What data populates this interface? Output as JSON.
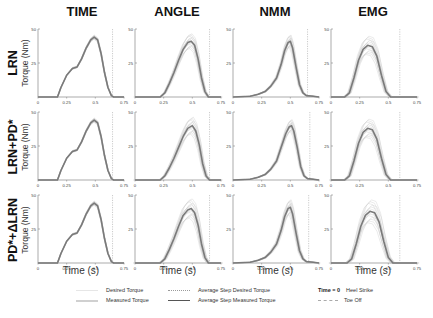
{
  "figure": {
    "column_titles": [
      "TIME",
      "ANGLE",
      "NMM",
      "EMG"
    ],
    "row_labels": [
      {
        "main": "LRN",
        "sub": "Torque (Nm)"
      },
      {
        "main": "LRN+PD*",
        "sub": "Torque (Nm)"
      },
      {
        "main": "PD*+ΔLRN",
        "sub": "Torque (Nm)"
      }
    ],
    "xlabel": "Time (s)",
    "legend": {
      "desired": "Desired Torque",
      "measured": "Measured Torque",
      "avg_desired": "Average Step Desired Torque",
      "avg_measured": "Average Step Measured Torque",
      "heel_strike_key": "Time = 0",
      "heel_strike": "Heel Strike",
      "toe_off": "Toe Off"
    },
    "colors": {
      "avg_measured": "#7a7a7a",
      "individual": "#c8c8c8",
      "axis": "#888888",
      "toe_off": "#aaaaaa"
    }
  },
  "chart_data": [
    {
      "type": "line",
      "row": "LRN",
      "column": "TIME",
      "title": "TIME",
      "xlabel": "",
      "ylabel": "Torque (Nm)",
      "xlim": [
        0,
        0.75
      ],
      "ylim": [
        0,
        50
      ],
      "xticks": [
        0,
        0.25,
        0.5,
        0.75
      ],
      "yticks": [
        0,
        25,
        50
      ],
      "toe_off": 0.65,
      "spread": 1.5,
      "x": [
        0,
        0.17,
        0.2,
        0.25,
        0.3,
        0.34,
        0.38,
        0.42,
        0.46,
        0.49,
        0.52,
        0.55,
        0.58,
        0.61,
        0.64,
        0.66,
        0.7,
        0.75
      ],
      "series": [
        {
          "name": "Average Step Measured Torque",
          "values": [
            0,
            0,
            7,
            16,
            21,
            22,
            28,
            36,
            42,
            44,
            42,
            32,
            18,
            7,
            1,
            0,
            0,
            0
          ]
        }
      ]
    },
    {
      "type": "line",
      "row": "LRN",
      "column": "ANGLE",
      "title": "ANGLE",
      "xlabel": "",
      "ylabel": "",
      "xlim": [
        0,
        0.75
      ],
      "ylim": [
        0,
        50
      ],
      "xticks": [
        0,
        0.25,
        0.5,
        0.75
      ],
      "yticks": [
        0,
        25,
        50
      ],
      "toe_off": 0.65,
      "spread": 6,
      "x": [
        0,
        0.22,
        0.26,
        0.3,
        0.34,
        0.38,
        0.42,
        0.46,
        0.49,
        0.52,
        0.55,
        0.58,
        0.61,
        0.64,
        0.7,
        0.75
      ],
      "series": [
        {
          "name": "Average Step Measured Torque",
          "values": [
            0,
            0,
            3,
            10,
            18,
            27,
            35,
            40,
            41,
            38,
            28,
            14,
            4,
            0,
            0,
            0
          ]
        }
      ]
    },
    {
      "type": "line",
      "row": "LRN",
      "column": "NMM",
      "title": "NMM",
      "xlabel": "",
      "ylabel": "",
      "xlim": [
        0,
        0.75
      ],
      "ylim": [
        0,
        50
      ],
      "xticks": [
        0,
        0.25,
        0.5,
        0.75
      ],
      "yticks": [
        0,
        25,
        50
      ],
      "toe_off": 0.65,
      "spread": 5,
      "x": [
        0,
        0.15,
        0.22,
        0.28,
        0.33,
        0.38,
        0.42,
        0.45,
        0.48,
        0.5,
        0.52,
        0.55,
        0.58,
        0.61,
        0.64,
        0.7,
        0.75
      ],
      "series": [
        {
          "name": "Average Step Measured Torque",
          "values": [
            0,
            0.5,
            2,
            4,
            8,
            14,
            24,
            34,
            40,
            41,
            36,
            22,
            9,
            3,
            1,
            0.5,
            0
          ]
        }
      ]
    },
    {
      "type": "line",
      "row": "LRN",
      "column": "EMG",
      "title": "EMG",
      "xlabel": "",
      "ylabel": "",
      "xlim": [
        0,
        0.75
      ],
      "ylim": [
        0,
        50
      ],
      "xticks": [
        0,
        0.25,
        0.5,
        0.75
      ],
      "yticks": [
        0,
        25,
        50
      ],
      "toe_off": 0.6,
      "spread": 8,
      "x": [
        0,
        0.12,
        0.16,
        0.2,
        0.24,
        0.28,
        0.32,
        0.36,
        0.4,
        0.44,
        0.48,
        0.52,
        0.56,
        0.75
      ],
      "series": [
        {
          "name": "Average Step Measured Torque",
          "values": [
            0,
            0,
            3,
            14,
            27,
            35,
            38,
            37,
            30,
            16,
            4,
            0,
            0,
            0
          ]
        }
      ]
    },
    {
      "type": "line",
      "row": "LRN+PD*",
      "column": "TIME",
      "title": "",
      "xlabel": "",
      "ylabel": "Torque (Nm)",
      "xlim": [
        0,
        0.75
      ],
      "ylim": [
        0,
        50
      ],
      "xticks": [
        0,
        0.25,
        0.5,
        0.75
      ],
      "yticks": [
        0,
        25,
        50
      ],
      "toe_off": 0.65,
      "spread": 1.5,
      "x": [
        0,
        0.17,
        0.2,
        0.25,
        0.3,
        0.34,
        0.38,
        0.42,
        0.46,
        0.49,
        0.52,
        0.55,
        0.58,
        0.61,
        0.64,
        0.66,
        0.7,
        0.75
      ],
      "series": [
        {
          "name": "Average Step Measured Torque",
          "values": [
            0,
            0,
            7,
            16,
            21,
            22,
            28,
            36,
            42,
            44,
            42,
            32,
            18,
            7,
            1,
            0,
            0,
            0
          ]
        }
      ]
    },
    {
      "type": "line",
      "row": "LRN+PD*",
      "column": "ANGLE",
      "title": "",
      "xlabel": "",
      "ylabel": "",
      "xlim": [
        0,
        0.75
      ],
      "ylim": [
        0,
        50
      ],
      "xticks": [
        0,
        0.25,
        0.5,
        0.75
      ],
      "yticks": [
        0,
        25,
        50
      ],
      "toe_off": 0.65,
      "spread": 7,
      "x": [
        0,
        0.22,
        0.26,
        0.3,
        0.34,
        0.38,
        0.42,
        0.46,
        0.5,
        0.53,
        0.56,
        0.59,
        0.62,
        0.65,
        0.7,
        0.75
      ],
      "series": [
        {
          "name": "Average Step Measured Torque",
          "values": [
            0,
            0,
            3,
            9,
            16,
            24,
            32,
            38,
            40,
            36,
            26,
            12,
            3,
            0,
            0,
            0
          ]
        }
      ]
    },
    {
      "type": "line",
      "row": "LRN+PD*",
      "column": "NMM",
      "title": "",
      "xlabel": "",
      "ylabel": "",
      "xlim": [
        0,
        0.75
      ],
      "ylim": [
        0,
        50
      ],
      "xticks": [
        0,
        0.25,
        0.5,
        0.75
      ],
      "yticks": [
        0,
        25,
        50
      ],
      "toe_off": 0.67,
      "spread": 5,
      "x": [
        0,
        0.15,
        0.22,
        0.28,
        0.33,
        0.38,
        0.42,
        0.46,
        0.49,
        0.51,
        0.53,
        0.56,
        0.59,
        0.62,
        0.65,
        0.7,
        0.75
      ],
      "series": [
        {
          "name": "Average Step Measured Torque",
          "values": [
            0,
            0.5,
            2,
            4,
            8,
            14,
            24,
            34,
            39,
            40,
            36,
            24,
            10,
            3,
            1,
            0.5,
            0
          ]
        }
      ]
    },
    {
      "type": "line",
      "row": "LRN+PD*",
      "column": "EMG",
      "title": "",
      "xlabel": "",
      "ylabel": "",
      "xlim": [
        0,
        0.75
      ],
      "ylim": [
        0,
        50
      ],
      "xticks": [
        0,
        0.25,
        0.5,
        0.75
      ],
      "yticks": [
        0,
        25,
        50
      ],
      "toe_off": 0.6,
      "spread": 8,
      "x": [
        0,
        0.12,
        0.16,
        0.2,
        0.24,
        0.28,
        0.32,
        0.36,
        0.4,
        0.44,
        0.48,
        0.52,
        0.56,
        0.75
      ],
      "series": [
        {
          "name": "Average Step Measured Torque",
          "values": [
            0,
            0,
            3,
            14,
            27,
            35,
            38,
            37,
            30,
            16,
            4,
            0,
            0,
            0
          ]
        }
      ]
    },
    {
      "type": "line",
      "row": "PD*+ΔLRN",
      "column": "TIME",
      "title": "",
      "xlabel": "Time (s)",
      "ylabel": "Torque (Nm)",
      "xlim": [
        0,
        0.75
      ],
      "ylim": [
        0,
        50
      ],
      "xticks": [
        0,
        0.25,
        0.5,
        0.75
      ],
      "yticks": [
        0,
        25,
        50
      ],
      "toe_off": 0.65,
      "spread": 1.5,
      "x": [
        0,
        0.17,
        0.2,
        0.25,
        0.3,
        0.34,
        0.38,
        0.42,
        0.46,
        0.49,
        0.52,
        0.55,
        0.58,
        0.61,
        0.64,
        0.66,
        0.7,
        0.75
      ],
      "series": [
        {
          "name": "Average Step Measured Torque",
          "values": [
            0,
            0,
            7,
            16,
            21,
            22,
            28,
            36,
            42,
            44,
            42,
            32,
            18,
            7,
            1,
            0,
            0,
            0
          ]
        }
      ]
    },
    {
      "type": "line",
      "row": "PD*+ΔLRN",
      "column": "ANGLE",
      "title": "",
      "xlabel": "Time (s)",
      "ylabel": "",
      "xlim": [
        0,
        0.75
      ],
      "ylim": [
        0,
        50
      ],
      "xticks": [
        0,
        0.25,
        0.5,
        0.75
      ],
      "yticks": [
        0,
        25,
        50
      ],
      "toe_off": 0.65,
      "spread": 8,
      "x": [
        0,
        0.22,
        0.26,
        0.3,
        0.34,
        0.38,
        0.42,
        0.46,
        0.49,
        0.52,
        0.55,
        0.58,
        0.61,
        0.64,
        0.7,
        0.75
      ],
      "series": [
        {
          "name": "Average Step Measured Torque",
          "values": [
            0,
            0,
            3,
            10,
            18,
            27,
            35,
            39,
            40,
            37,
            28,
            14,
            4,
            0,
            0,
            0
          ]
        }
      ]
    },
    {
      "type": "line",
      "row": "PD*+ΔLRN",
      "column": "NMM",
      "title": "",
      "xlabel": "Time (s)",
      "ylabel": "",
      "xlim": [
        0,
        0.75
      ],
      "ylim": [
        0,
        50
      ],
      "xticks": [
        0,
        0.25,
        0.5,
        0.75
      ],
      "yticks": [
        0,
        25,
        50
      ],
      "toe_off": 0.66,
      "spread": 6,
      "x": [
        0,
        0.15,
        0.22,
        0.28,
        0.33,
        0.38,
        0.42,
        0.45,
        0.48,
        0.5,
        0.52,
        0.55,
        0.58,
        0.61,
        0.64,
        0.7,
        0.75
      ],
      "series": [
        {
          "name": "Average Step Measured Torque",
          "values": [
            0,
            0.5,
            2,
            4,
            8,
            14,
            24,
            34,
            40,
            41,
            36,
            22,
            9,
            3,
            1,
            0.5,
            0
          ]
        }
      ]
    },
    {
      "type": "line",
      "row": "PD*+ΔLRN",
      "column": "EMG",
      "title": "",
      "xlabel": "Time (s)",
      "ylabel": "",
      "xlim": [
        0,
        0.75
      ],
      "ylim": [
        0,
        50
      ],
      "xticks": [
        0,
        0.25,
        0.5,
        0.75
      ],
      "yticks": [
        0,
        25,
        50
      ],
      "toe_off": 0.6,
      "spread": 10,
      "x": [
        0,
        0.14,
        0.18,
        0.22,
        0.26,
        0.3,
        0.34,
        0.38,
        0.42,
        0.46,
        0.5,
        0.54,
        0.58,
        0.75
      ],
      "series": [
        {
          "name": "Average Step Measured Torque",
          "values": [
            0,
            0,
            3,
            14,
            27,
            35,
            38,
            37,
            30,
            16,
            4,
            0,
            0,
            0
          ]
        }
      ]
    }
  ]
}
